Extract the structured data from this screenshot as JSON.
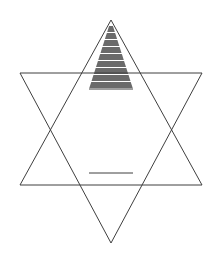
{
  "figure": {
    "background_color": "#ffffff",
    "line_color": "#3f3f3f",
    "line_width": 1,
    "shading_color": "#6a6a6a",
    "shading_style": "horizontal-stripes",
    "canvas": {
      "width": 220,
      "height": 253
    }
  },
  "geometry": {
    "description": "Hexagram formed by two overlapping equilateral triangles",
    "points": {
      "top": {
        "x": 111,
        "y": 20
      },
      "upper_right": {
        "x": 202,
        "y": 73
      },
      "lower_right": {
        "x": 202,
        "y": 185
      },
      "bottom": {
        "x": 111,
        "y": 243
      },
      "lower_left": {
        "x": 20,
        "y": 185
      },
      "upper_left": {
        "x": 20,
        "y": 73
      }
    },
    "inner_hexagon": {
      "top_left": {
        "x": 89,
        "y": 89
      },
      "top_right": {
        "x": 133,
        "y": 89
      },
      "right": {
        "x": 155,
        "y": 130
      },
      "bottom_right": {
        "x": 133,
        "y": 173
      },
      "bottom_left": {
        "x": 89,
        "y": 173
      },
      "left": {
        "x": 67,
        "y": 130
      }
    },
    "upward_triangle": "111,20 202,185 20,185",
    "downward_triangle": "111,243 20,73 202,73",
    "shaded_point": "111,20 133,89 89,89"
  },
  "shading": {
    "region_name": "top-point",
    "band_count": 9,
    "bands": [
      {
        "index": 1,
        "y_top": 26,
        "y_bottom": 32
      },
      {
        "index": 2,
        "y_top": 33,
        "y_bottom": 39
      },
      {
        "index": 3,
        "y_top": 40,
        "y_bottom": 46
      },
      {
        "index": 4,
        "y_top": 47,
        "y_bottom": 53
      },
      {
        "index": 5,
        "y_top": 54,
        "y_bottom": 60
      },
      {
        "index": 6,
        "y_top": 61,
        "y_bottom": 67
      },
      {
        "index": 7,
        "y_top": 68,
        "y_bottom": 74
      },
      {
        "index": 8,
        "y_top": 75,
        "y_bottom": 81
      },
      {
        "index": 9,
        "y_top": 82,
        "y_bottom": 88
      }
    ]
  },
  "labels": {
    "figure_caption": "",
    "alt_text": "Six-pointed star outline with horizontally striped upper point"
  }
}
